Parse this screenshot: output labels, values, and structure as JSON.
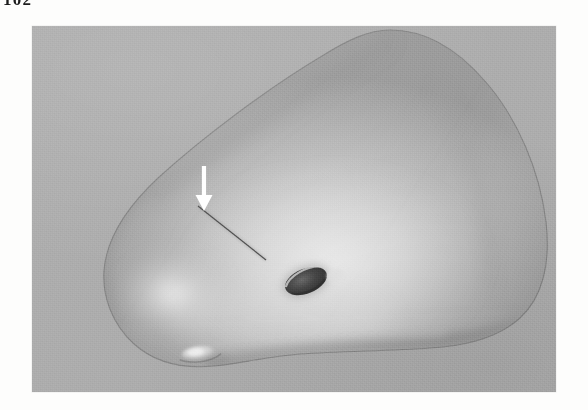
{
  "page": {
    "folio": "102",
    "background_color": "#fdfdfc"
  },
  "figure": {
    "name": "3d-surface-rendering",
    "kind": "grayscale 3D surface rendering",
    "plate_background_color": "#adadad",
    "plate": {
      "x": 32,
      "y": 26,
      "width": 524,
      "height": 366
    },
    "object": {
      "name": "rendered-anatomical-surface",
      "fill_light": "#ededed",
      "fill_mid": "#b4b4b4",
      "fill_dark": "#6f6f6f",
      "outline_color": "#6a6a6a"
    },
    "annotations": [
      {
        "name": "pointer-arrow",
        "type": "arrow",
        "color": "#ffffff",
        "direction": "down",
        "tail": [
          204,
          166
        ],
        "head": [
          204,
          209
        ]
      },
      {
        "name": "surface-groove-line",
        "type": "line",
        "color": "#4a4a4a",
        "from": [
          198,
          206
        ],
        "to": [
          266,
          260
        ]
      },
      {
        "name": "foramen-opening",
        "type": "ellipse",
        "color": "#3d3d3d",
        "center": [
          306,
          281
        ],
        "rx": 22,
        "ry": 13,
        "rotation": -22
      },
      {
        "name": "bony-tubercle",
        "type": "highlight-nodule",
        "color": "#e3e3e3",
        "center": [
          199,
          353
        ],
        "rx": 15,
        "ry": 6
      }
    ]
  }
}
